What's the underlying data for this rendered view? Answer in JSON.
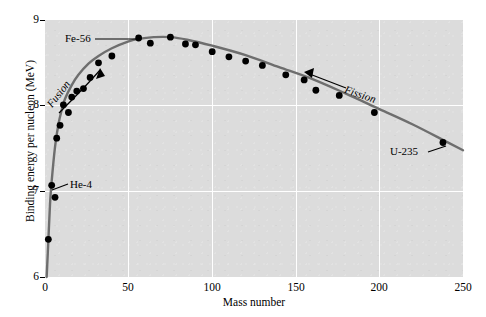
{
  "chart_data": {
    "type": "scatter",
    "title": "",
    "xlabel": "Mass number",
    "ylabel": "Binding energy per nucleon (MeV)",
    "xlim": [
      0,
      250
    ],
    "ylim": [
      6,
      9
    ],
    "xticks": [
      "0",
      "50",
      "100",
      "150",
      "200",
      "250"
    ],
    "xtick_values": [
      0,
      50,
      100,
      150,
      200,
      250
    ],
    "yticks": [
      "6",
      "7",
      "8",
      "9"
    ],
    "ytick_values": [
      6,
      7,
      8,
      9
    ],
    "grid": true,
    "grid_color": "#ffffff",
    "plot_bg_color": "#dcdcdc",
    "point_color": "#000000",
    "line_color": "#6e6e6e",
    "legend": "none",
    "points": [
      {
        "x": 2,
        "y": 6.44
      },
      {
        "x": 6,
        "y": 6.93
      },
      {
        "x": 4,
        "y": 7.07,
        "label": "He-4"
      },
      {
        "x": 7,
        "y": 7.62
      },
      {
        "x": 9,
        "y": 7.77
      },
      {
        "x": 11,
        "y": 8.01
      },
      {
        "x": 14,
        "y": 7.92
      },
      {
        "x": 16,
        "y": 8.1
      },
      {
        "x": 19,
        "y": 8.17
      },
      {
        "x": 23,
        "y": 8.2
      },
      {
        "x": 27,
        "y": 8.33
      },
      {
        "x": 32,
        "y": 8.5
      },
      {
        "x": 40,
        "y": 8.58
      },
      {
        "x": 56,
        "y": 8.79,
        "label": "Fe-56"
      },
      {
        "x": 63,
        "y": 8.73
      },
      {
        "x": 75,
        "y": 8.8
      },
      {
        "x": 84,
        "y": 8.72
      },
      {
        "x": 90,
        "y": 8.71
      },
      {
        "x": 100,
        "y": 8.63
      },
      {
        "x": 110,
        "y": 8.57
      },
      {
        "x": 120,
        "y": 8.52
      },
      {
        "x": 130,
        "y": 8.47
      },
      {
        "x": 144,
        "y": 8.36
      },
      {
        "x": 155,
        "y": 8.3
      },
      {
        "x": 162,
        "y": 8.18
      },
      {
        "x": 176,
        "y": 8.12
      },
      {
        "x": 197,
        "y": 7.92
      },
      {
        "x": 238,
        "y": 7.57,
        "label": "U-235"
      }
    ],
    "curve": [
      {
        "x": 1,
        "y": 6.0
      },
      {
        "x": 2,
        "y": 6.42
      },
      {
        "x": 3,
        "y": 6.85
      },
      {
        "x": 4,
        "y": 7.12
      },
      {
        "x": 6,
        "y": 7.52
      },
      {
        "x": 8,
        "y": 7.78
      },
      {
        "x": 10,
        "y": 7.95
      },
      {
        "x": 12,
        "y": 8.08
      },
      {
        "x": 16,
        "y": 8.24
      },
      {
        "x": 20,
        "y": 8.36
      },
      {
        "x": 26,
        "y": 8.49
      },
      {
        "x": 32,
        "y": 8.58
      },
      {
        "x": 40,
        "y": 8.67
      },
      {
        "x": 50,
        "y": 8.75
      },
      {
        "x": 56,
        "y": 8.78
      },
      {
        "x": 65,
        "y": 8.8
      },
      {
        "x": 75,
        "y": 8.8
      },
      {
        "x": 85,
        "y": 8.77
      },
      {
        "x": 100,
        "y": 8.7
      },
      {
        "x": 120,
        "y": 8.59
      },
      {
        "x": 140,
        "y": 8.45
      },
      {
        "x": 160,
        "y": 8.31
      },
      {
        "x": 180,
        "y": 8.14
      },
      {
        "x": 200,
        "y": 7.96
      },
      {
        "x": 220,
        "y": 7.78
      },
      {
        "x": 240,
        "y": 7.58
      },
      {
        "x": 250,
        "y": 7.48
      }
    ],
    "annotations": [
      {
        "name": "fe56-label",
        "text": "Fe-56",
        "kind": "leader-line"
      },
      {
        "name": "he4-label",
        "text": "He-4",
        "kind": "leader-line"
      },
      {
        "name": "u235-label",
        "text": "U-235",
        "kind": "leader-line"
      },
      {
        "name": "fusion-label",
        "text": "Fusion",
        "kind": "arrow"
      },
      {
        "name": "fission-label",
        "text": "Fission",
        "kind": "arrow"
      }
    ]
  },
  "axes": {
    "xlabel": "Mass number",
    "ylabel": "Binding energy per nucleon (MeV)",
    "xticks": [
      "0",
      "50",
      "100",
      "150",
      "200",
      "250"
    ],
    "yticks": [
      "9",
      "8",
      "7",
      "6"
    ]
  },
  "labels": {
    "fe56": "Fe-56",
    "he4": "He-4",
    "u235": "U-235",
    "fusion": "Fusion",
    "fission": "Fission"
  }
}
